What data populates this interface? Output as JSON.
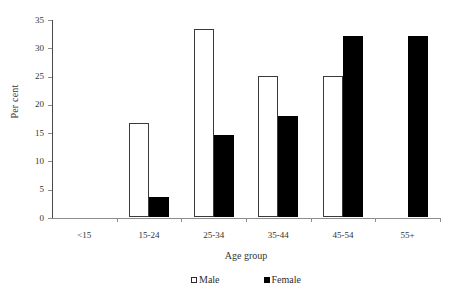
{
  "chart_data": {
    "type": "bar",
    "title": "",
    "subtitle": "",
    "xlabel": "Age group",
    "ylabel": "Per cent",
    "categories": [
      "<15",
      "15-24",
      "25-34",
      "35-44",
      "45-54",
      "55+"
    ],
    "series": [
      {
        "name": "Male",
        "color": "#ffffff",
        "edge_color": "#3a3a3a",
        "values": [
          0,
          16.6,
          33.2,
          25.0,
          25.0,
          0
        ]
      },
      {
        "name": "Female",
        "color": "#000000",
        "edge_color": "#000000",
        "values": [
          0,
          3.5,
          14.5,
          17.8,
          32.0,
          32.0
        ]
      }
    ],
    "ylim": [
      0,
      35
    ],
    "ytick_values": [
      0,
      5,
      10,
      15,
      20,
      25,
      30,
      35
    ],
    "ytick_labels": [
      "0",
      "5",
      "10",
      "15",
      "20",
      "25",
      "30",
      "35"
    ],
    "grid": false,
    "legend_position": "bottom-center",
    "legend": [
      {
        "label": "Male",
        "marker": "open-square"
      },
      {
        "label": "Female",
        "marker": "filled-square"
      }
    ]
  }
}
